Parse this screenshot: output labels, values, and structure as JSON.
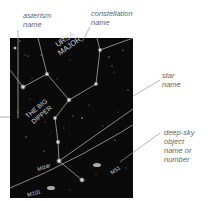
{
  "callouts": {
    "asterism": {
      "line1": "asterism",
      "line2": "name"
    },
    "constellation": {
      "line1": "constellation",
      "line2": "name"
    },
    "star": {
      "line1": "star",
      "line2": "name"
    },
    "deep_sky": {
      "line1": "deep-sky",
      "line2": "object",
      "line3": "name or",
      "line4": "number"
    }
  },
  "map": {
    "constellation_label": {
      "line1": "URSA",
      "line2": "MAJOR"
    },
    "asterism_label": {
      "line1": "THE BIG",
      "line2": "DIPPER"
    },
    "star_label": "Mizar",
    "deep_sky_labels": [
      "M101",
      "M51"
    ]
  },
  "colors": {
    "sky": "#0a0a0a",
    "lines": "#bdbdbd",
    "text_on_map": "#cfcfcf",
    "callout_text": "#666666"
  }
}
